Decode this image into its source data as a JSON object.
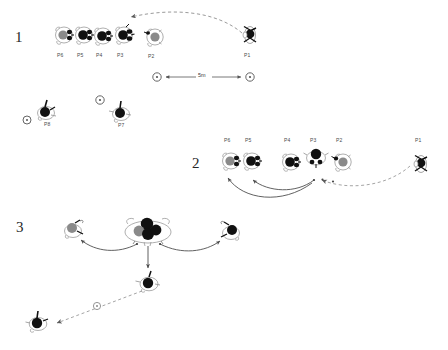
{
  "figure": {
    "background_color": "#ffffff",
    "line_color": "#4a4a4a",
    "dash_color": "#8c8c8c",
    "head_dark_color": "#0d0d0d",
    "head_gray_color": "#8a8a8a",
    "body_outline_color": "#6b6b6b"
  },
  "panels": [
    {
      "id": "panel-1",
      "number": "1",
      "players": [
        {
          "id": "p6",
          "label": "P6",
          "head": "gray",
          "view": "top-back",
          "x": 60,
          "y": 30
        },
        {
          "id": "p5",
          "label": "P5",
          "head": "dark",
          "view": "top-back",
          "x": 80,
          "y": 30
        },
        {
          "id": "p4",
          "label": "P4",
          "head": "dark",
          "view": "top-back",
          "x": 99,
          "y": 31
        },
        {
          "id": "p3",
          "label": "P3",
          "head": "dark",
          "view": "top-back",
          "x": 120,
          "y": 30
        },
        {
          "id": "p2",
          "label": "P2",
          "head": "gray",
          "view": "top-back",
          "x": 150,
          "y": 32
        },
        {
          "id": "p1",
          "label": "P1",
          "head": "dark",
          "view": "side",
          "x": 247,
          "y": 31
        }
      ],
      "measurement": {
        "value": "5m",
        "left_marker": "cone",
        "right_marker": "cone"
      },
      "ball_path": {
        "type": "dashed-arc",
        "from": "P1",
        "to": "P3"
      }
    },
    {
      "id": "panel-2",
      "number": "2",
      "players": [
        {
          "id": "p6",
          "label": "P6",
          "head": "gray",
          "view": "top-back",
          "x": 227,
          "y": 158
        },
        {
          "id": "p5",
          "label": "P5",
          "head": "dark",
          "view": "top-back",
          "x": 248,
          "y": 158
        },
        {
          "id": "p4",
          "label": "P4",
          "head": "dark",
          "view": "top-back",
          "x": 287,
          "y": 159
        },
        {
          "id": "p3",
          "label": "P3",
          "head": "dark",
          "view": "top-front",
          "x": 313,
          "y": 155
        },
        {
          "id": "p2",
          "label": "P2",
          "head": "gray",
          "view": "top-back",
          "x": 339,
          "y": 158
        },
        {
          "id": "p1",
          "label": "P1",
          "head": "dark",
          "view": "side",
          "x": 418,
          "y": 160
        }
      ],
      "ball_path": {
        "type": "dashed-arc",
        "from": "P1",
        "to": "P3"
      },
      "movement_arcs": [
        {
          "from": "P3",
          "to": "P5"
        },
        {
          "from": "P3",
          "to": "P6"
        }
      ]
    },
    {
      "id": "panel-3",
      "number": "3",
      "players": [
        {
          "id": "cluster",
          "label": "",
          "head": "cluster",
          "view": "top-cluster",
          "x": 147,
          "y": 230
        },
        {
          "id": "left",
          "label": "",
          "head": "gray",
          "view": "top-back",
          "x": 72,
          "y": 228
        },
        {
          "id": "right",
          "label": "",
          "head": "dark",
          "view": "top-back",
          "x": 228,
          "y": 230
        },
        {
          "id": "below",
          "label": "",
          "head": "dark",
          "view": "top-back",
          "x": 148,
          "y": 281
        },
        {
          "id": "far",
          "label": "",
          "head": "dark",
          "view": "top-back",
          "x": 37,
          "y": 320
        }
      ],
      "ball_path": {
        "type": "dashed-line",
        "from": "below",
        "to": "far",
        "has_ball_marker": true
      },
      "movement_arcs": [
        {
          "from": "cluster",
          "to": "left"
        },
        {
          "from": "cluster",
          "to": "right"
        },
        {
          "from": "cluster",
          "to": "below"
        }
      ]
    }
  ]
}
